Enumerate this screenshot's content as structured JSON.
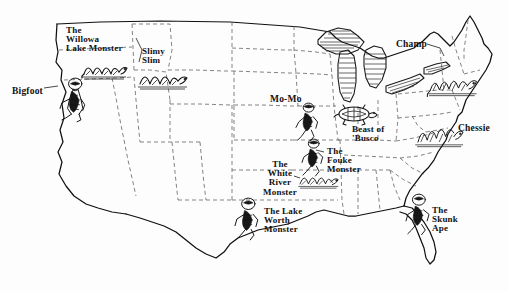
{
  "map": {
    "title": "Cryptid Map of the United States",
    "background_color": "#fdfdfd",
    "ink_color": "#141414",
    "state_border_color": "#6d6d6d",
    "coast_color": "#101010"
  },
  "cryptids": [
    {
      "id": "bigfoot",
      "label": "Bigfoot",
      "lines": "Bigfoot",
      "creature_icon": "bigfoot-ape-icon",
      "region": "Pacific Northwest / Northern California",
      "label_x": 12,
      "label_y": 87,
      "align": "left",
      "size": "lbl-lg"
    },
    {
      "id": "willowa-lake-monster",
      "label": "The Willowa Lake Monster",
      "lines": "The\nWillowa\nLake Monster",
      "creature_icon": "lake-serpent-icon",
      "region": "Oregon",
      "label_x": 66,
      "label_y": 26,
      "align": "left",
      "size": "lbl-md"
    },
    {
      "id": "slimy-slim",
      "label": "Slimy Slim",
      "lines": "Slimy\nSlim",
      "creature_icon": "lake-serpent-icon",
      "region": "Idaho",
      "label_x": 142,
      "label_y": 47,
      "align": "left",
      "size": "lbl-md"
    },
    {
      "id": "mo-mo",
      "label": "Mo-Mo",
      "lines": "Mo-Mo",
      "creature_icon": "hairy-hominid-icon",
      "region": "Missouri",
      "label_x": 270,
      "label_y": 95,
      "align": "left",
      "size": "lbl-lg"
    },
    {
      "id": "beast-of-busco",
      "label": "Beast of 'Busco",
      "lines": "Beast of\n'Busco",
      "creature_icon": "giant-turtle-icon",
      "region": "Indiana",
      "label_x": 352,
      "label_y": 125,
      "align": "left",
      "size": "lbl-md"
    },
    {
      "id": "champ",
      "label": "Champ",
      "lines": "Champ",
      "creature_icon": "lake-serpent-icon",
      "region": "Lake Champlain, Vermont / New York",
      "label_x": 396,
      "label_y": 40,
      "align": "left",
      "size": "lbl-lg"
    },
    {
      "id": "chessie",
      "label": "Chessie",
      "lines": "Chessie",
      "creature_icon": "sea-serpent-icon",
      "region": "Chesapeake Bay",
      "label_x": 458,
      "label_y": 124,
      "align": "left",
      "size": "lbl-lg"
    },
    {
      "id": "fouke-monster",
      "label": "The Fouke Monster",
      "lines": "The\nFouke\nMonster",
      "creature_icon": "hairy-hominid-icon",
      "region": "Arkansas",
      "label_x": 327,
      "label_y": 147,
      "align": "left",
      "size": "lbl-md"
    },
    {
      "id": "white-river-monster",
      "label": "The White River Monster",
      "lines": "The\nWhite\nRiver\nMonster",
      "creature_icon": "river-serpent-icon",
      "region": "Arkansas",
      "label_x": 253,
      "label_y": 160,
      "align": "center",
      "size": "lbl-md"
    },
    {
      "id": "lake-worth-monster",
      "label": "The Lake Worth Monster",
      "lines": "The Lake\nWorth\nMonster",
      "creature_icon": "hairy-hominid-icon",
      "region": "Texas",
      "label_x": 264,
      "label_y": 207,
      "align": "left",
      "size": "lbl-md"
    },
    {
      "id": "skunk-ape",
      "label": "The Skunk Ape",
      "lines": "The\nSkunk\nApe",
      "creature_icon": "skunk-ape-icon",
      "region": "Florida",
      "label_x": 432,
      "label_y": 206,
      "align": "left",
      "size": "lbl-md"
    }
  ],
  "map_features": {
    "great_lakes": [
      "Lake Superior",
      "Lake Michigan",
      "Lake Huron",
      "Lake Erie",
      "Lake Ontario"
    ],
    "border_style": "dashed state lines, solid national outline"
  }
}
